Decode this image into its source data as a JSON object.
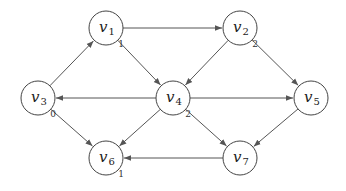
{
  "diagram": {
    "type": "directed-graph",
    "node_radius": 17,
    "nodes": [
      {
        "id": "v1",
        "base": "v",
        "sub": "1",
        "x": 106,
        "y": 28,
        "annotation": "1"
      },
      {
        "id": "v2",
        "base": "v",
        "sub": "2",
        "x": 240,
        "y": 28,
        "annotation": "2"
      },
      {
        "id": "v3",
        "base": "v",
        "sub": "3",
        "x": 38,
        "y": 98,
        "annotation": "0"
      },
      {
        "id": "v4",
        "base": "v",
        "sub": "4",
        "x": 173,
        "y": 98,
        "annotation": "2"
      },
      {
        "id": "v5",
        "base": "v",
        "sub": "5",
        "x": 311,
        "y": 98,
        "annotation": ""
      },
      {
        "id": "v6",
        "base": "v",
        "sub": "6",
        "x": 106,
        "y": 158,
        "annotation": "1"
      },
      {
        "id": "v7",
        "base": "v",
        "sub": "7",
        "x": 240,
        "y": 158,
        "annotation": ""
      }
    ],
    "edges": [
      {
        "from": "v1",
        "to": "v2"
      },
      {
        "from": "v1",
        "to": "v4"
      },
      {
        "from": "v3",
        "to": "v1"
      },
      {
        "from": "v2",
        "to": "v4"
      },
      {
        "from": "v2",
        "to": "v5"
      },
      {
        "from": "v4",
        "to": "v3"
      },
      {
        "from": "v4",
        "to": "v5"
      },
      {
        "from": "v4",
        "to": "v6"
      },
      {
        "from": "v4",
        "to": "v7"
      },
      {
        "from": "v3",
        "to": "v6"
      },
      {
        "from": "v5",
        "to": "v7"
      },
      {
        "from": "v7",
        "to": "v6"
      }
    ],
    "colors": {
      "stroke": "#444444",
      "edge": "#555555",
      "background": "#ffffff"
    }
  }
}
